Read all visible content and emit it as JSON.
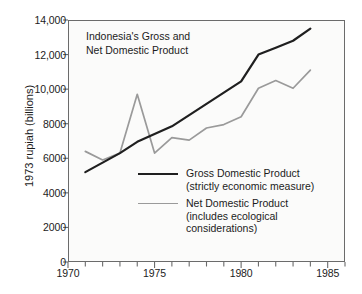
{
  "chart_data": {
    "type": "line",
    "title": "Indonesia's Gross and\nNet Domestic Product",
    "xlabel": "",
    "ylabel": "1973 rupiah (billions)",
    "xlim": [
      1970,
      1986
    ],
    "ylim": [
      0,
      14000
    ],
    "grid": false,
    "legend_position": "inside-center-right",
    "x_ticks_major": [
      "1970",
      "1975",
      "1980",
      "1985"
    ],
    "x_ticks_major_values": [
      1970,
      1975,
      1980,
      1985
    ],
    "x_ticks_minor_values": [
      1971,
      1972,
      1973,
      1974,
      1976,
      1977,
      1978,
      1979,
      1981,
      1982,
      1983,
      1984,
      1986
    ],
    "y_ticks": [
      "0",
      "2000",
      "4000",
      "6000",
      "8000",
      "10,000",
      "12,000",
      "14,000"
    ],
    "y_tick_values": [
      0,
      2000,
      4000,
      6000,
      8000,
      10000,
      12000,
      14000
    ],
    "series": [
      {
        "name": "Gross Domestic Product",
        "sublabel": "(strictly economic measure)",
        "color": "#1f1f1f",
        "x": [
          1971,
          1972,
          1973,
          1974,
          1975,
          1976,
          1977,
          1978,
          1979,
          1980,
          1981,
          1982,
          1983,
          1984
        ],
        "values": [
          5200,
          5750,
          6300,
          6950,
          7400,
          7850,
          8500,
          9150,
          9800,
          10450,
          12000,
          12400,
          12800,
          13500
        ]
      },
      {
        "name": "Net Domestic Product",
        "sublabel": "(includes ecological\nconsiderations)",
        "color": "#9a9a9a",
        "x": [
          1971,
          1972,
          1973,
          1974,
          1975,
          1976,
          1977,
          1978,
          1979,
          1980,
          1981,
          1982,
          1983,
          1984
        ],
        "values": [
          6400,
          5900,
          6300,
          9700,
          6300,
          7200,
          7050,
          7750,
          7950,
          8400,
          10050,
          10500,
          10050,
          11100
        ]
      }
    ]
  },
  "axis": {
    "y_title": "1973 rupiah (billions)"
  },
  "legend": {
    "entries": [
      {
        "label": "Gross Domestic Product",
        "sublabel": "(strictly economic measure)"
      },
      {
        "label": "Net Domestic Product",
        "sublabel": "(includes ecological\nconsiderations)"
      }
    ]
  },
  "colors": {
    "gross": "#1f1f1f",
    "net": "#9a9a9a",
    "axis": "#6b6b6b",
    "plot_background": "#fbfbfa",
    "page_background": "#ffffff"
  }
}
